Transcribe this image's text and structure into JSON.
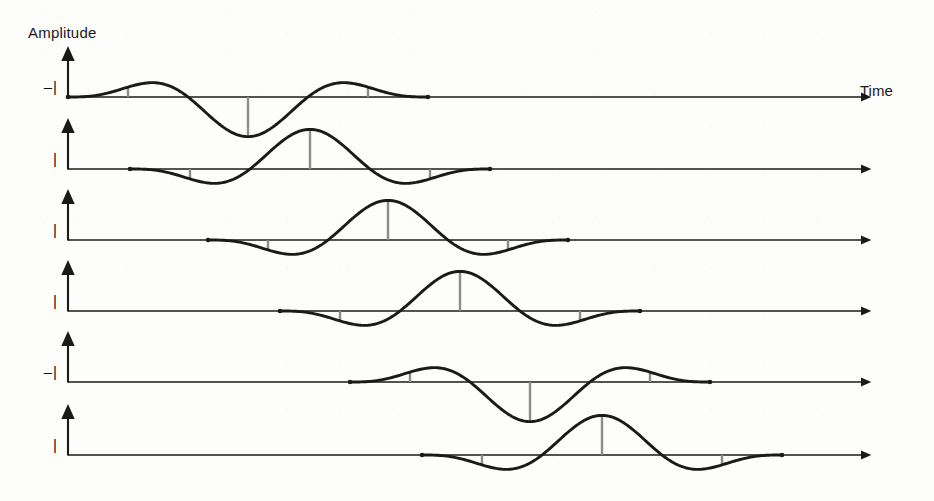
{
  "figure": {
    "type": "wavelet-moveout-diagram",
    "background_color": "#fdfdfc",
    "axis_color": "#1a1a1a",
    "trace_color": "#1a1a1a",
    "stem_color": "#8c8c8c",
    "axis_labels": {
      "y_axis_title": "Amplitude",
      "x_axis_title": "Time"
    },
    "geometry": {
      "axis_origin_x": 68,
      "axis_end_x": 862,
      "axis_arrow_tip_x": 872,
      "y_axis_top_offset": 38,
      "row_spacing": 71,
      "trace_amplitude": 30,
      "wavelet_length": 360,
      "stem_count": 5
    },
    "traces": [
      {
        "index": 1,
        "tick_label": "–|",
        "baseline_y": 97,
        "start_x": 68,
        "end_x": 492,
        "polarity": -1,
        "shape": "peak-trough-peak",
        "delay": 0
      },
      {
        "index": 2,
        "tick_label": "|",
        "baseline_y": 169,
        "start_x": 130,
        "end_x": 562,
        "polarity": 1,
        "shape": "trough-peak-trough",
        "delay": 62
      },
      {
        "index": 3,
        "tick_label": "|",
        "baseline_y": 240,
        "start_x": 208,
        "end_x": 636,
        "polarity": 1,
        "shape": "trough-peak-trough",
        "delay": 140
      },
      {
        "index": 4,
        "tick_label": "|",
        "baseline_y": 311,
        "start_x": 280,
        "end_x": 706,
        "polarity": 1,
        "shape": "trough-peak-trough",
        "delay": 212
      },
      {
        "index": 5,
        "tick_label": "–|",
        "baseline_y": 382,
        "start_x": 350,
        "end_x": 776,
        "polarity": -1,
        "shape": "peak-trough-peak",
        "delay": 282
      },
      {
        "index": 6,
        "tick_label": "|",
        "baseline_y": 455,
        "start_x": 422,
        "end_x": 848,
        "polarity": 1,
        "shape": "trough-peak-trough",
        "delay": 354
      }
    ]
  },
  "chart_data": {
    "type": "line",
    "title": "",
    "xlabel": "Time",
    "ylabel": "Amplitude",
    "grid": false,
    "legend": "none",
    "x": [
      0,
      0.125,
      0.25,
      0.375,
      0.5,
      0.625,
      0.75,
      0.875,
      1
    ],
    "series": [
      {
        "name": "trace-1",
        "tick_label": "–|",
        "delay": 0,
        "polarity": -1,
        "values": [
          0,
          0.62,
          1.0,
          0.42,
          -0.85,
          -0.38,
          0.55,
          0.92,
          0
        ]
      },
      {
        "name": "trace-2",
        "tick_label": "|",
        "delay": 62,
        "polarity": 1,
        "values": [
          0,
          -0.28,
          -0.42,
          0.05,
          0.82,
          0.95,
          0.18,
          -0.45,
          0
        ]
      },
      {
        "name": "trace-3",
        "tick_label": "|",
        "delay": 140,
        "polarity": 1,
        "values": [
          0,
          -0.3,
          -0.45,
          0.08,
          0.85,
          0.98,
          0.2,
          -0.48,
          0
        ]
      },
      {
        "name": "trace-4",
        "tick_label": "|",
        "delay": 212,
        "polarity": 1,
        "values": [
          0,
          -0.3,
          -0.45,
          0.08,
          0.85,
          0.98,
          0.2,
          -0.48,
          0
        ]
      },
      {
        "name": "trace-5",
        "tick_label": "–|",
        "delay": 282,
        "polarity": -1,
        "values": [
          0,
          0.62,
          1.0,
          0.42,
          -0.85,
          -0.38,
          0.55,
          0.92,
          0
        ]
      },
      {
        "name": "trace-6",
        "tick_label": "|",
        "delay": 354,
        "polarity": 1,
        "values": [
          0,
          -0.3,
          -0.45,
          0.08,
          0.85,
          0.98,
          0.2,
          -0.48,
          0
        ]
      }
    ]
  }
}
